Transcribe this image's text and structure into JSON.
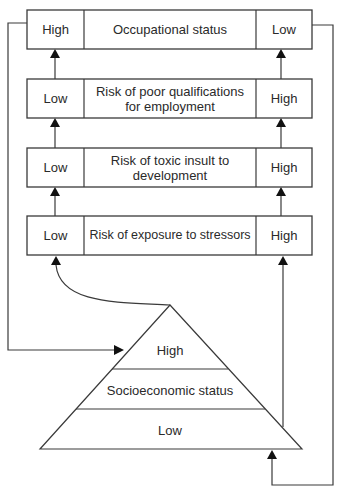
{
  "diagram": {
    "rows": [
      {
        "left": "High",
        "center": "Occupational status",
        "right": "Low"
      },
      {
        "left": "Low",
        "center": "Risk of poor qualifications for employment",
        "right": "High"
      },
      {
        "left": "Low",
        "center": "Risk of toxic insult to development",
        "right": "High"
      },
      {
        "left": "Low",
        "center": "Risk of exposure to stressors",
        "right": "High"
      }
    ],
    "pyramid": {
      "top": "High",
      "middle": "Socioeconomic status",
      "bottom": "Low"
    },
    "colors": {
      "line": "#3a3a3a",
      "arrow": "#111111",
      "text": "#2a2a2a",
      "background": "#ffffff"
    }
  }
}
